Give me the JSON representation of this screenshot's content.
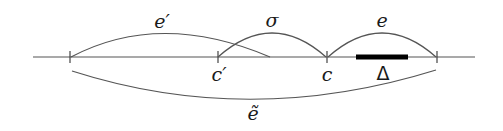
{
  "diagram": {
    "labels": {
      "e_prime": "e′",
      "sigma": "σ",
      "e": "e",
      "c_prime": "c′",
      "c": "c",
      "delta": "Δ",
      "e_tilde": "ẽ"
    },
    "points": [
      {
        "name": "left-end",
        "x": 70
      },
      {
        "name": "c_prime",
        "x": 218
      },
      {
        "name": "c",
        "x": 327
      },
      {
        "name": "right-end",
        "x": 437
      }
    ],
    "segment_delta": {
      "x_start": 356,
      "x_end": 408
    },
    "colors": {
      "line": "#555555",
      "bar": "#000000"
    }
  }
}
